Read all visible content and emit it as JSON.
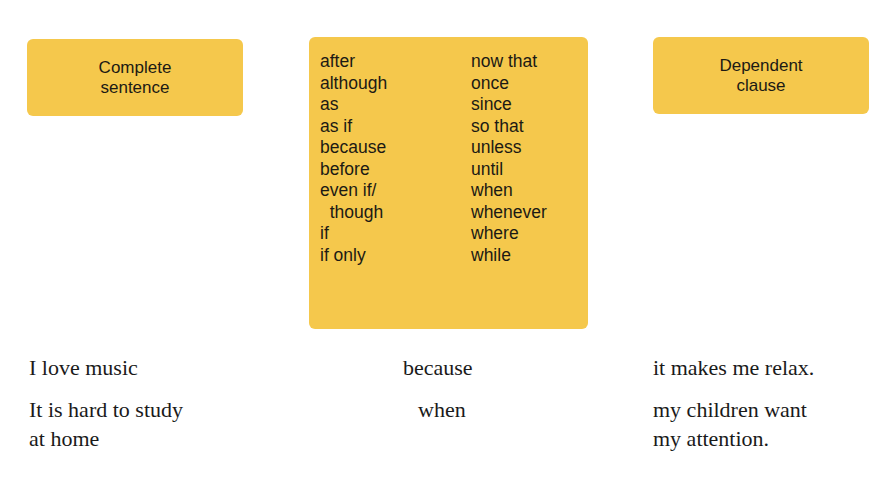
{
  "labels": {
    "complete_sentence": [
      "Complete",
      "sentence"
    ],
    "dependent_clause": [
      "Dependent",
      "clause"
    ]
  },
  "conjunctions": {
    "column_1": [
      "after",
      "although",
      "as",
      "as if",
      "because",
      "before",
      "even if/",
      "  though",
      "if",
      "if only"
    ],
    "column_2": [
      "now that",
      "once",
      "since",
      "so that",
      "unless",
      "until",
      "when",
      "whenever",
      "where",
      "while"
    ]
  },
  "examples": [
    {
      "complete_sentence": [
        "I love music"
      ],
      "conjunction": "because",
      "dependent_clause": [
        "it makes me relax."
      ]
    },
    {
      "complete_sentence": [
        "It is hard to study",
        "at home"
      ],
      "conjunction": "when",
      "dependent_clause": [
        "my children want",
        "my attention."
      ]
    }
  ],
  "colors": {
    "box_fill": "#F5C84C",
    "text": "#1a1a1a"
  }
}
